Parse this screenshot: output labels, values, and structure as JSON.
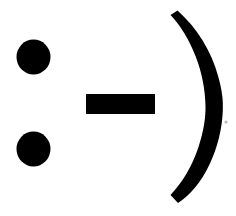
{
  "image": {
    "kind": "emoticon-glyph-artwork",
    "caption": ":-)",
    "meaning": "smiley face",
    "width": 236,
    "height": 216,
    "background_color": "#ffffff",
    "ink_color": "#000000"
  },
  "glyphs": {
    "colon": {
      "character": ":",
      "name": "colon-eyes",
      "color": "#000000",
      "upper_dot": {
        "name": "upper-eye-dot",
        "shape": "circle",
        "cx": 33.5,
        "cy": 57,
        "rx": 17,
        "ry": 17.5
      },
      "lower_dot": {
        "name": "lower-eye-dot",
        "shape": "circle",
        "cx": 33.5,
        "cy": 149,
        "rx": 17,
        "ry": 17.5
      }
    },
    "hyphen": {
      "character": "-",
      "name": "hyphen-nose",
      "shape": "rectangle",
      "color": "#000000",
      "x": 86,
      "y": 94,
      "width": 69,
      "height": 20
    },
    "paren": {
      "character": ")",
      "name": "closing-paren-mouth",
      "shape": "crescent",
      "color": "#000000",
      "top_tip_x": 178,
      "top_tip_y": 10,
      "bottom_tip_x": 178,
      "bottom_tip_y": 203,
      "widest_x": 222,
      "widest_y": 108
    },
    "speck": {
      "name": "scan-speck-artifact",
      "color": "#b9b9b9",
      "cx": 226,
      "cy": 122,
      "r": 1.6
    }
  }
}
